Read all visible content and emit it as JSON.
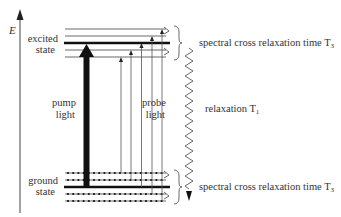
{
  "diagram": {
    "type": "energy-level-diagram",
    "axis": {
      "label": "E"
    },
    "excited_state": {
      "label_line1": "excited",
      "label_line2": "state"
    },
    "ground_state": {
      "label_line1": "ground",
      "label_line2": "state"
    },
    "pump": {
      "label_line1": "pump",
      "label_line2": "light"
    },
    "probe": {
      "label_line1": "probe",
      "label_line2": "light"
    },
    "relaxation": {
      "label": "relaxation T",
      "subscript": "1"
    },
    "spectral_top": {
      "label": "spectral cross relaxation time T",
      "subscript": "3"
    },
    "spectral_bottom": {
      "label": "spectral cross relaxation time T",
      "subscript": "3"
    },
    "colors": {
      "line": "#222222",
      "thin_line": "#555555",
      "text": "#333333",
      "background": "#ffffff"
    }
  }
}
